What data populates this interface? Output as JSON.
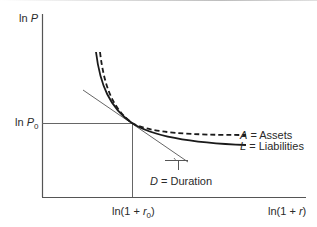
{
  "figure": {
    "y_axis_label_prefix": "ln ",
    "y_axis_label_var": "P",
    "y_tick_prefix": "ln ",
    "y_tick_var": "P",
    "y_tick_sub": "0",
    "x_tick_text_a": "ln(1 + ",
    "x_tick_var": "r",
    "x_tick_sub": "0",
    "x_tick_text_b": ")",
    "x_axis_label_a": "ln(1 + ",
    "x_axis_label_var": "r",
    "x_axis_label_b": ")",
    "legend": {
      "assets_symbol": "A",
      "assets_text": " = Assets",
      "liabilities_symbol": "L",
      "liabilities_text": " = Liabilities",
      "duration_symbol": "D",
      "duration_text": " = Duration"
    },
    "colors": {
      "axis": "#555555",
      "curve": "#1a1a1a",
      "tangent": "#666666",
      "text": "#2a2a2a"
    }
  }
}
